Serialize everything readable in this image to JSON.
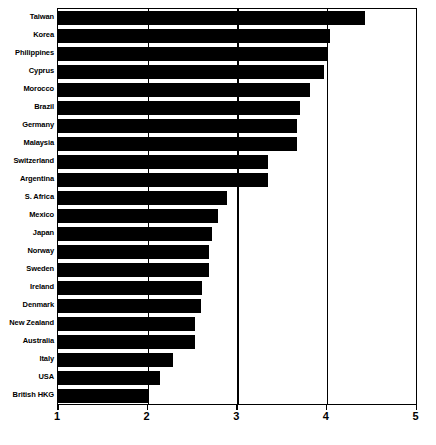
{
  "chart_data": {
    "type": "bar",
    "orientation": "horizontal",
    "title": "",
    "subtitle": "",
    "xlabel": "",
    "ylabel": "",
    "xlim": [
      1,
      5
    ],
    "ylim": null,
    "grid": true,
    "grid_axis": "x",
    "legend": null,
    "legend_position": "none",
    "bar_color": "#000000",
    "xticks": [
      1,
      2,
      3,
      4,
      5
    ],
    "xtick_labels": [
      "1",
      "2",
      "3",
      "4",
      "5"
    ],
    "categories": [
      "Taiwan",
      "Korea",
      "Philippines",
      "Cyprus",
      "Morocco",
      "Brazil",
      "Germany",
      "Malaysia",
      "Switzerland",
      "Argentina",
      "S. Africa",
      "Mexico",
      "Japan",
      "Norway",
      "Sweden",
      "Ireland",
      "Denmark",
      "New Zealand",
      "Australia",
      "Italy",
      "USA",
      "British HKG"
    ],
    "values": [
      4.42,
      4.03,
      4.01,
      3.97,
      3.81,
      3.7,
      3.67,
      3.67,
      3.34,
      3.34,
      2.89,
      2.78,
      2.72,
      2.69,
      2.68,
      2.61,
      2.59,
      2.53,
      2.53,
      2.28,
      2.14,
      2.01
    ]
  }
}
